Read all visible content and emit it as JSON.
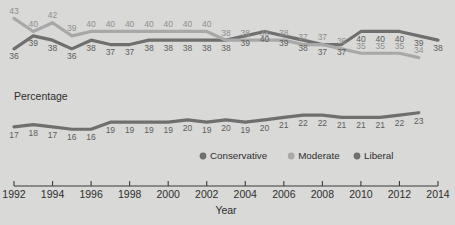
{
  "chart_data": {
    "type": "line",
    "title": "",
    "xlabel": "Year",
    "ylabel": "Percentage",
    "x": [
      1992,
      1993,
      1994,
      1995,
      1996,
      1997,
      1998,
      1999,
      2000,
      2001,
      2002,
      2003,
      2004,
      2005,
      2006,
      2007,
      2008,
      2009,
      2010,
      2011,
      2012,
      2013
    ],
    "xlim": [
      1992,
      2014
    ],
    "xticks": [
      1992,
      1994,
      1996,
      1998,
      2000,
      2002,
      2004,
      2006,
      2008,
      2010,
      2012,
      2014
    ],
    "xticklabels": [
      "1992",
      "1994",
      "1996",
      "1998",
      "2000",
      "2002",
      "2004",
      "2006",
      "2008",
      "2010",
      "2012",
      "2014"
    ],
    "grid": false,
    "legend_position": "bottom-center",
    "panels": [
      {
        "name": "upper",
        "ylim": [
          33,
          44
        ],
        "series": [
          {
            "name": "Conservative",
            "color": "#6f6f6f",
            "values": [
              36,
              39,
              38,
              36,
              38,
              37,
              37,
              38,
              38,
              38,
              38,
              38,
              39,
              40,
              39,
              38,
              37,
              37,
              40,
              40,
              40,
              39
            ],
            "end_label": "38",
            "end_value": 38
          },
          {
            "name": "Moderate",
            "color": "#a8a8a8",
            "values": [
              43,
              40,
              42,
              39,
              40,
              40,
              40,
              40,
              40,
              40,
              40,
              38,
              38,
              38,
              38,
              37,
              37,
              36,
              35,
              35,
              35
            ],
            "end_label": "34",
            "end_value": 34
          }
        ]
      },
      {
        "name": "lower",
        "ylim": [
          14,
          25
        ],
        "series": [
          {
            "name": "Liberal",
            "color": "#6f6f6f",
            "values": [
              17,
              18,
              17,
              16,
              16,
              19,
              19,
              19,
              19,
              20,
              19,
              20,
              19,
              20,
              21,
              22,
              22,
              21,
              21,
              21,
              22,
              23
            ]
          }
        ]
      }
    ],
    "legend": [
      {
        "label": "Conservative",
        "color": "#6f6f6f"
      },
      {
        "label": "Moderate",
        "color": "#a8a8a8"
      },
      {
        "label": "Liberal",
        "color": "#6f6f6f"
      }
    ],
    "value_labels": {
      "conservative": [
        "36",
        "39",
        "38",
        "36",
        "38",
        "37",
        "37",
        "38",
        "38",
        "38",
        "38",
        "38",
        "37",
        "37",
        "37",
        "38",
        "38",
        "38",
        "37",
        "37",
        "37",
        "36",
        "35",
        "35",
        "35",
        "34"
      ],
      "moderate_upper": [
        "43",
        "40",
        "42",
        "39",
        "40",
        "40",
        "40",
        "40",
        "40",
        "40",
        "39",
        "38",
        "37",
        "37",
        "40",
        "40",
        "40",
        "39",
        "38"
      ],
      "liberal": [
        "17",
        "18",
        "17",
        "16",
        "16",
        "19",
        "19",
        "19",
        "19",
        "20",
        "19",
        "20",
        "19",
        "20",
        "21",
        "22",
        "22",
        "21",
        "21",
        "21",
        "22",
        "23"
      ]
    },
    "background_color": "#d9d9d7"
  },
  "labels": {
    "percentage": "Percentage",
    "year": "Year"
  }
}
